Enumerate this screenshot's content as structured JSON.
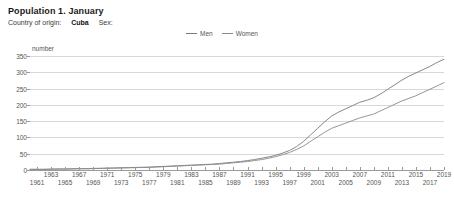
{
  "header": {
    "title": "Population 1. January",
    "filter_label_origin": "Country of origin:",
    "filter_value_origin": "Cuba",
    "filter_label_sex": "Sex:"
  },
  "chart_data": {
    "type": "line",
    "title": "Population 1. January",
    "xlabel": "",
    "ylabel": "number",
    "ylim": [
      0,
      350
    ],
    "yticks": [
      0,
      50,
      100,
      150,
      200,
      250,
      300,
      350
    ],
    "xlim": [
      1960,
      2019
    ],
    "grid": true,
    "legend_position": "top-right",
    "legend": [
      "Men",
      "Women"
    ],
    "xticks": [
      1961,
      1963,
      1965,
      1967,
      1969,
      1971,
      1973,
      1975,
      1977,
      1979,
      1981,
      1983,
      1985,
      1987,
      1989,
      1991,
      1993,
      1995,
      1997,
      1999,
      2001,
      2003,
      2005,
      2007,
      2009,
      2011,
      2013,
      2015,
      2017,
      2019
    ],
    "x": [
      1960,
      1961,
      1962,
      1963,
      1964,
      1965,
      1966,
      1967,
      1968,
      1969,
      1970,
      1971,
      1972,
      1973,
      1974,
      1975,
      1976,
      1977,
      1978,
      1979,
      1980,
      1981,
      1982,
      1983,
      1984,
      1985,
      1986,
      1987,
      1988,
      1989,
      1990,
      1991,
      1992,
      1993,
      1994,
      1995,
      1996,
      1997,
      1998,
      1999,
      2000,
      2001,
      2002,
      2003,
      2004,
      2005,
      2006,
      2007,
      2008,
      2009,
      2010,
      2011,
      2012,
      2013,
      2014,
      2015,
      2016,
      2017,
      2018,
      2019
    ],
    "series": [
      {
        "name": "Men",
        "color": "#7a7a7a",
        "values": [
          2,
          2,
          2,
          3,
          3,
          3,
          4,
          4,
          4,
          5,
          5,
          6,
          6,
          7,
          7,
          8,
          8,
          9,
          10,
          11,
          12,
          13,
          14,
          15,
          16,
          17,
          18,
          20,
          22,
          24,
          26,
          29,
          32,
          36,
          40,
          45,
          52,
          60,
          72,
          88,
          108,
          128,
          148,
          166,
          178,
          188,
          198,
          208,
          214,
          222,
          234,
          248,
          262,
          276,
          288,
          298,
          308,
          318,
          330,
          340
        ]
      },
      {
        "name": "Women",
        "color": "#8a8a8a",
        "values": [
          2,
          2,
          2,
          2,
          3,
          3,
          3,
          4,
          4,
          4,
          5,
          5,
          6,
          6,
          7,
          7,
          8,
          8,
          9,
          10,
          11,
          12,
          13,
          14,
          15,
          16,
          17,
          18,
          20,
          22,
          24,
          26,
          29,
          32,
          36,
          41,
          47,
          54,
          63,
          74,
          88,
          102,
          116,
          128,
          136,
          144,
          152,
          160,
          166,
          172,
          182,
          192,
          202,
          212,
          220,
          228,
          238,
          248,
          258,
          268
        ]
      }
    ]
  }
}
